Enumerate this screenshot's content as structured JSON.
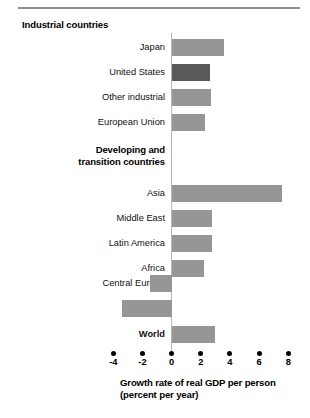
{
  "chart_data": {
    "type": "bar",
    "orientation": "horizontal",
    "title": "",
    "xlabel": "Growth rate of real GDP per person (percent per year)",
    "ylabel": "",
    "xlim": [
      -4,
      8
    ],
    "xticks": [
      -4,
      -2,
      0,
      2,
      4,
      6,
      8
    ],
    "xtick_labels": [
      "-4",
      "-2",
      "0",
      "2",
      "4",
      "6",
      "8"
    ],
    "grid": false,
    "legend": null,
    "group_headings": [
      {
        "label": "Industrial countries",
        "after_index": -1
      },
      {
        "label": "Developing and\ntransition countries",
        "after_index": 3
      }
    ],
    "categories": [
      "Japan",
      "United States",
      "Other industrial",
      "European Union",
      "Asia",
      "Middle East",
      "Latin America",
      "Africa",
      "Central Europe",
      "Russia",
      "World"
    ],
    "values": [
      3.6,
      2.6,
      2.7,
      2.3,
      7.6,
      2.8,
      2.8,
      2.2,
      -1.5,
      -3.4,
      3.0
    ],
    "highlighted": [
      "United States"
    ],
    "bold_labels": [
      "World"
    ]
  },
  "axis": {
    "title_line1": "Growth rate of real GDP per person",
    "title_line2": "(percent per year)"
  },
  "headings": {
    "industrial": "Industrial countries",
    "developing_line1": "Developing and",
    "developing_line2": "transition countries"
  },
  "colors": {
    "bar": "#969696",
    "bar_highlight": "#595959",
    "axis_line": "#b7b7b7",
    "rule": "#8c8c8c",
    "text": "#000000"
  }
}
